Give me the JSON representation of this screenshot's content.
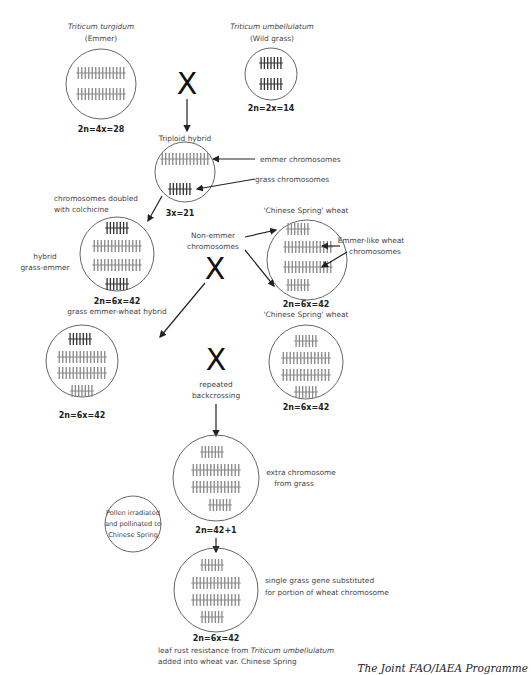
{
  "top_strip": {
    "note": "cropped header text (illegible)"
  },
  "parents": {
    "emmer": {
      "title": "Triticum turgidum",
      "subtitle": "(Emmer)",
      "ploidy": "2n=4x=28"
    },
    "grass": {
      "title": "Triticum umbellulatum",
      "subtitle": "(Wild grass)",
      "ploidy": "2n=2x=14"
    },
    "cross_symbol": "X"
  },
  "triploid": {
    "title": "Triploid hybrid",
    "ploidy": "3x=21",
    "label_emmer": "emmer chromosomes",
    "label_grass": "grass chromosomes"
  },
  "doubling": {
    "note_line1": "chromosomes doubled",
    "note_line2": "with colchicine",
    "side_line1": "hybrid",
    "side_line2": "grass-emmer",
    "ploidy": "2n=6x=42",
    "caption": "grass emmer-wheat hybrid"
  },
  "chinese_spring_1": {
    "title": "'Chinese Spring' wheat",
    "ploidy": "2n=6x=42",
    "caption": "'Chinese Spring' wheat",
    "label_nonemmer_1": "Non-emmer",
    "label_nonemmer_2": "chromosomes",
    "label_emmerlike_1": "Emmer-like wheat",
    "label_emmerlike_2": "chromosomes",
    "cross_symbol": "X"
  },
  "backcross": {
    "left_ploidy": "2n=6x=42",
    "right_ploidy": "2n=6x=42",
    "cross_symbol": "X",
    "label_line1": "repeated",
    "label_line2": "backcrossing"
  },
  "extra": {
    "ploidy": "2n=42+1",
    "label_line1": "extra chromosome",
    "label_line2": "from grass"
  },
  "pollen_note": {
    "line1": "Pollen irradiated",
    "line2": "and pollinated to",
    "line3": "Chinese Spring"
  },
  "final": {
    "ploidy": "2n=6x=42",
    "label_line1": "single grass gene substituted",
    "label_line2": "for portion of wheat chromosome",
    "caption_line1_a": "leaf rust resistance from ",
    "caption_line1_b": "Triticum umbellulatum",
    "caption_line2": "added into wheat var. Chinese Spring"
  },
  "credit": "The Joint FAO/IAEA Programme"
}
